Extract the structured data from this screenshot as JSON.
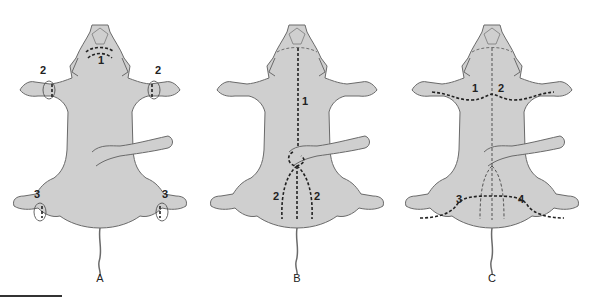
{
  "figure": {
    "colors": {
      "body_fill": "#cfcfcf",
      "outline": "#6a6a6a",
      "incision": "#222222",
      "background": "#ffffff"
    },
    "panels": [
      {
        "label": "A",
        "incisions": [
          {
            "number": "1",
            "location": "neck/throat, curved line"
          },
          {
            "number": "2",
            "location": "left forelimb, circular cut"
          },
          {
            "number": "2",
            "location": "right forelimb, circular cut"
          },
          {
            "number": "3",
            "location": "left hindlimb, circular cut"
          },
          {
            "number": "3",
            "location": "right hindlimb, circular cut"
          }
        ]
      },
      {
        "label": "B",
        "incisions": [
          {
            "number": "1",
            "location": "midline from throat to umbilical cord"
          },
          {
            "number": "2",
            "location": "left of midline, umbilicus to tail"
          },
          {
            "number": "2",
            "location": "right of midline, umbilicus to tail"
          }
        ]
      },
      {
        "label": "C",
        "incisions": [
          {
            "number": "1",
            "location": "across left forelimb to midline"
          },
          {
            "number": "2",
            "location": "across right forelimb to midline"
          },
          {
            "number": "3",
            "location": "across left hindlimb to midline"
          },
          {
            "number": "4",
            "location": "across right hindlimb to midline"
          }
        ]
      }
    ]
  },
  "labels": {
    "A": "A",
    "B": "B",
    "C": "C",
    "a1": "1",
    "a2l": "2",
    "a2r": "2",
    "a3l": "3",
    "a3r": "3",
    "b1": "1",
    "b2l": "2",
    "b2r": "2",
    "c1": "1",
    "c2": "2",
    "c3": "3",
    "c4": "4"
  }
}
